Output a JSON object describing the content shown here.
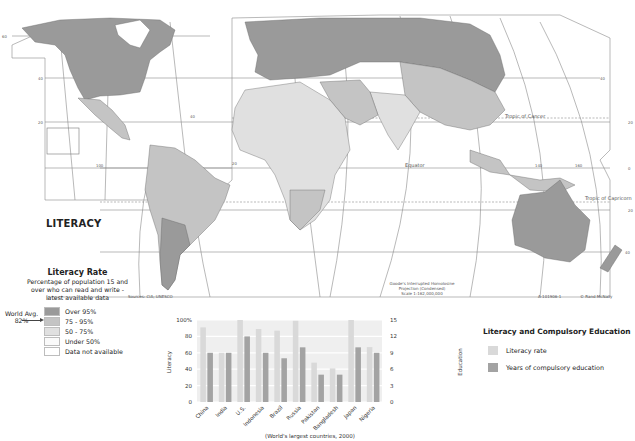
{
  "map": {
    "title": "LITERACY",
    "sources": "Sources: CIA; UNESCO",
    "projection_line1": "Goode's Interrupted Homolosine",
    "projection_line2": "Projection (Condensed)",
    "scale": "Scale 1:162,000,000",
    "map_code": "A-101906-1",
    "copyright": "© Rand McNally",
    "lines": {
      "tropic_cancer": "Tropic of Cancer",
      "tropic_capricorn": "Tropic of Capricorn",
      "equator": "Equator"
    },
    "lat_labels": [
      "60",
      "40",
      "20",
      "0",
      "20",
      "40",
      "60"
    ],
    "lon_labels": [
      "100",
      "80",
      "60",
      "40",
      "20",
      "140",
      "160"
    ],
    "colors": {
      "over95": "#9a9a9a",
      "75to95": "#c4c4c4",
      "50to75": "#e0e0e0",
      "under50": "#fafafa",
      "na": "#ffffff"
    }
  },
  "legend": {
    "title": "Literacy Rate",
    "subtitle_lines": [
      "Percentage of population 15 and",
      "over who can read and write -",
      "latest available data"
    ],
    "world_avg_label": "World Avg.",
    "world_avg_value": "82%",
    "items": [
      {
        "label": "Over 95%",
        "color": "#9a9a9a"
      },
      {
        "label": "75 - 95%",
        "color": "#c4c4c4"
      },
      {
        "label": "50 - 75%",
        "color": "#e0e0e0"
      },
      {
        "label": "Under 50%",
        "color": "#fafafa"
      },
      {
        "label": "Data not available",
        "color": "#ffffff"
      }
    ]
  },
  "chart_legend": {
    "title": "Literacy and Compulsory Education",
    "items": [
      {
        "label": "Literacy rate",
        "color": "#d9d9d9"
      },
      {
        "label": "Years of compulsory education",
        "color": "#a3a3a3"
      }
    ]
  },
  "chart_data": {
    "type": "bar",
    "title": "Literacy and Compulsory Education",
    "xlabel": "(World's largest countries, 2000)",
    "ylabel": "Literacy",
    "y2label": "Education",
    "categories": [
      "China",
      "India",
      "U.S.",
      "Indonesia",
      "Brazil",
      "Russia",
      "Pakistan",
      "Bangladesh",
      "Japan",
      "Nigeria"
    ],
    "ylim": [
      0,
      100
    ],
    "y2lim": [
      0,
      15
    ],
    "yticks": [
      "0",
      "20",
      "40",
      "60",
      "80",
      "100%"
    ],
    "y2ticks": [
      "0",
      "3",
      "6",
      "9",
      "12",
      "15"
    ],
    "grid": true,
    "series": [
      {
        "name": "Literacy rate",
        "axis": "left",
        "color": "#d9d9d9",
        "values": [
          91,
          60,
          100,
          89,
          87,
          99,
          48,
          41,
          100,
          67
        ]
      },
      {
        "name": "Years of compulsory education",
        "axis": "right",
        "color": "#a3a3a3",
        "values": [
          9,
          9,
          12,
          9,
          8,
          10,
          5,
          5,
          10,
          9
        ]
      }
    ]
  }
}
